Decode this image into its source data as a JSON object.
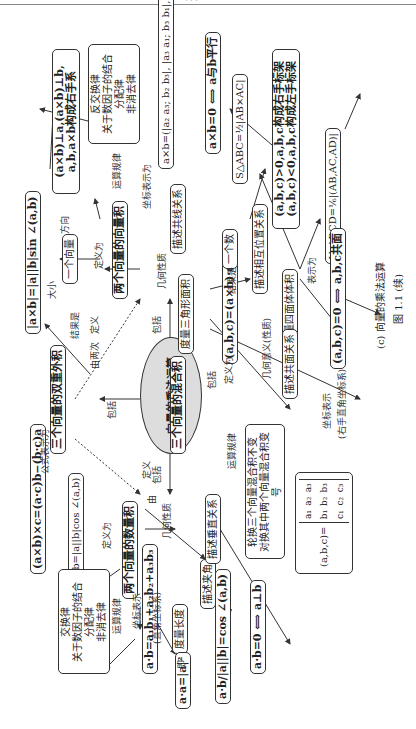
{
  "header": {
    "text": "· · ·"
  },
  "center": {
    "label": "向量的乘法运算"
  },
  "main_nodes": {
    "dot": "两个向量的数量积",
    "cross": "两个向量的向量积",
    "mixed": "三个向量的混合积",
    "double_cross": "三个向量的双重外积"
  },
  "edge_labels": {
    "include": "包括",
    "include2": "包括",
    "include3": "包括",
    "include4": "包括",
    "defined_by_two": "由两次",
    "define": "定义",
    "by": "由",
    "define2": "定义",
    "define_as": "定义为",
    "define_as2": "定义为",
    "define_as3": "定义为",
    "formula_repr": "公式表示为",
    "result_is": "结果是",
    "result_is2": "结果是",
    "size": "大小",
    "direction": "方向",
    "op_rules": "运算规律",
    "op_rules2": "运算规律",
    "op_rules3": "运算规律",
    "coord_repr": "坐标表示为",
    "coord_repr2": "坐标表示",
    "coord_sys_right": "(直角坐标系)",
    "coord_repr3": "坐标表示",
    "coord_sys_rh": "(右手直角坐标系)",
    "geom": "几何性质",
    "geom2": "几何性质",
    "geom_meaning": "几何意义(性质)",
    "ie": "即",
    "repr_as": "表示为"
  },
  "nodes": {
    "double_formula": "(a×b)×c=(a·c)b−(b·c)a",
    "dot_def": "a·b=|a||b|cos ∠(a,b)",
    "dot_rules": [
      "交换律",
      "关于数因子的结合",
      "分配律",
      "非消去律"
    ],
    "dot_coord": "a·b=a₁b₁+a₂b₂+a₃b₃",
    "measure_length": "度量长度",
    "describe_angle": "描述夹角",
    "describe_perp": "描述垂直关系",
    "aa": "a·a=|a|²",
    "cos_formula_num": "a·b",
    "cos_formula_den": "|a||b|",
    "cos_formula_rhs": "=cos ∠(a,b)",
    "perp": "a·b=0 ⟺ a⊥b",
    "cross_size": "|a×b|=|a||b|sin ∠(a,b)",
    "a_vector": "一个向量",
    "cross_dir": [
      "(a×b)⊥a,(a×b)⊥b,",
      "a,b,a×b构成右手系"
    ],
    "cross_rules": [
      "反交换律",
      "关于数因子的结合",
      "分配律",
      "非消去律"
    ],
    "cross_coord": "a×b=(|a₂ a₃; b₂ b₃|, |a₃ a₁; b₃ b₁|, |a₁ a₂; b₁ b₂|)",
    "describe_collinear": "描述共线关系",
    "measure_triangle": "度量三角形面积",
    "parallel": "a×b=0 ⟺ a与b平行",
    "triangle_area": "S△ABC=½|AB×AC|",
    "mixed_def": "(a,b,c)=(a×b)·c",
    "a_number": "一个数",
    "describe_position": "描述相互位置关系",
    "measure_tetra": "度量四面体体积",
    "describe_coplanar": "描述共面关系",
    "orient": [
      "(a,b,c)>0,a,b,c构成右手标架",
      "(a,b,c)<0,a,b,c构成左手标架"
    ],
    "tetra_vol": "V_ABCD=⅙|(AB,AC,AD)|",
    "coplanar": "(a,b,c)=0 ⟺ a,b,c共面",
    "mixed_rules": [
      "轮换三个向量混合积不变",
      "对换其中两个向量混合积变号"
    ],
    "mixed_det_lhs": "(a,b,c)=",
    "mixed_det": [
      [
        "a₁",
        "a₂",
        "a₃"
      ],
      [
        "b₁",
        "b₂",
        "b₃"
      ],
      [
        "c₁",
        "c₂",
        "c₃"
      ]
    ]
  },
  "caption": {
    "sub": "(c) 向量的乘法运算",
    "fig": "图 1.1 (续)"
  }
}
